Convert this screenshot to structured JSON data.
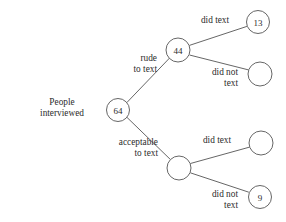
{
  "diagram": {
    "type": "probability-tree",
    "root_caption": {
      "line1": "People",
      "line2": "interviewed"
    },
    "colors": {
      "stroke": "#555555",
      "text": "#2b2b2b",
      "background": "#ffffff"
    },
    "nodes": [
      {
        "id": "root",
        "value": "64",
        "cx": 118,
        "cy": 110,
        "r": 11.5,
        "has_value": true
      },
      {
        "id": "rude",
        "value": "44",
        "cx": 178,
        "cy": 50,
        "r": 12.0,
        "has_value": true
      },
      {
        "id": "acceptable",
        "value": "",
        "cx": 179,
        "cy": 168,
        "r": 12.0,
        "has_value": false
      },
      {
        "id": "rude-did",
        "value": "13",
        "cx": 258,
        "cy": 22,
        "r": 11.5,
        "has_value": true
      },
      {
        "id": "rude-didnot",
        "value": "",
        "cx": 260,
        "cy": 74,
        "r": 12.0,
        "has_value": false
      },
      {
        "id": "acc-did",
        "value": "",
        "cx": 261,
        "cy": 143,
        "r": 12.0,
        "has_value": false
      },
      {
        "id": "acc-didnot",
        "value": "9",
        "cx": 260,
        "cy": 197,
        "r": 11.5,
        "has_value": true
      }
    ],
    "edges": [
      {
        "id": "root-to-rude",
        "from": "root",
        "to": "rude"
      },
      {
        "id": "root-to-acceptable",
        "from": "root",
        "to": "acceptable"
      },
      {
        "id": "rude-to-did",
        "from": "rude",
        "to": "rude-did"
      },
      {
        "id": "rude-to-didnot",
        "from": "rude",
        "to": "rude-didnot"
      },
      {
        "id": "acc-to-did",
        "from": "acceptable",
        "to": "acc-did"
      },
      {
        "id": "acc-to-didnot",
        "from": "acceptable",
        "to": "acc-didnot"
      }
    ],
    "branch_labels": {
      "rude": {
        "line1": "rude",
        "line2": "to text"
      },
      "acceptable": {
        "line1": "acceptable",
        "line2": "to text"
      },
      "rude_did": {
        "line1": "did text",
        "line2": ""
      },
      "rude_did_not": {
        "line1": "did not",
        "line2": "text"
      },
      "acc_did": {
        "line1": "did text",
        "line2": ""
      },
      "acc_did_not": {
        "line1": "did not",
        "line2": "text"
      }
    }
  }
}
